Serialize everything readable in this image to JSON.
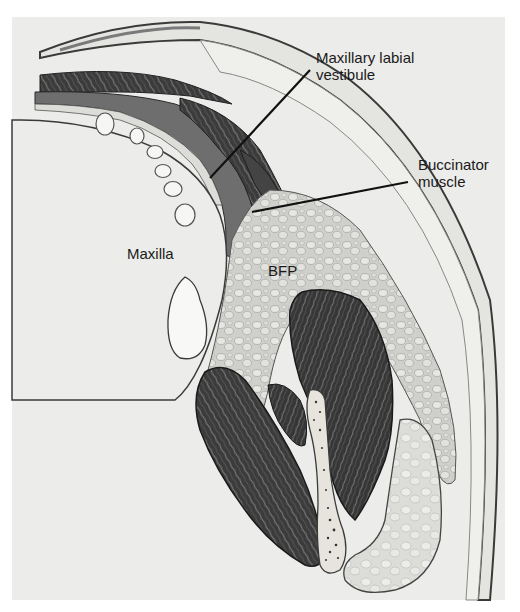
{
  "figure": {
    "type": "anatomical-illustration",
    "colors": {
      "background": "#ececea",
      "muscle": "#3a3a3a",
      "mucosa": "#6e6e6e",
      "fat": "#c9c9c6",
      "bone": "#f2f2ef",
      "outline": "#2a2a2a",
      "skin": "#e2e2df",
      "leader_line": "#111111"
    },
    "labels": {
      "vestibule_line1": "Maxillary labial",
      "vestibule_line2": "vestibule",
      "buccinator_line1": "Buccinator",
      "buccinator_line2": "muscle",
      "maxilla": "Maxilla",
      "bfp": "BFP"
    },
    "leader_lines": [
      {
        "target": "Maxillary labial vestibule",
        "from": [
          310,
          70
        ],
        "to": [
          210,
          178
        ]
      },
      {
        "target": "Buccinator muscle",
        "from": [
          408,
          182
        ],
        "to": [
          252,
          212
        ]
      }
    ]
  }
}
